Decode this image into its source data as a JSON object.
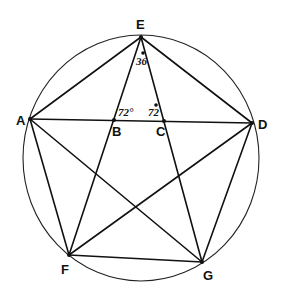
{
  "diagram": {
    "type": "inscribed-pentagon-with-pentagram",
    "colors": {
      "stroke": "#111111",
      "background": "#ffffff"
    },
    "circle": {
      "cx": 141,
      "cy": 158,
      "rx": 118,
      "ry": 123
    },
    "points": {
      "E": {
        "x": 141,
        "y": 37,
        "label": "E",
        "lx": 136,
        "ly": 29
      },
      "A": {
        "x": 30,
        "y": 119,
        "label": "A",
        "lx": 16,
        "ly": 125
      },
      "D": {
        "x": 252,
        "y": 123,
        "label": "D",
        "lx": 258,
        "ly": 129
      },
      "F": {
        "x": 69,
        "y": 255,
        "label": "F",
        "lx": 61,
        "ly": 274
      },
      "G": {
        "x": 202,
        "y": 262,
        "label": "G",
        "lx": 203,
        "ly": 280
      },
      "B": {
        "x": 114,
        "y": 120,
        "label": "B",
        "lx": 112,
        "ly": 136
      },
      "C": {
        "x": 164,
        "y": 121,
        "label": "C",
        "lx": 156,
        "ly": 136
      }
    },
    "segments": [
      [
        "A",
        "E"
      ],
      [
        "E",
        "D"
      ],
      [
        "D",
        "G"
      ],
      [
        "G",
        "F"
      ],
      [
        "F",
        "A"
      ],
      [
        "E",
        "F"
      ],
      [
        "E",
        "G"
      ],
      [
        "A",
        "D"
      ],
      [
        "A",
        "G"
      ],
      [
        "D",
        "F"
      ]
    ],
    "angle_labels": [
      {
        "text": "36",
        "x": 136,
        "y": 65
      },
      {
        "text": "72°",
        "x": 118,
        "y": 116
      },
      {
        "text": "72",
        "x": 148,
        "y": 116
      }
    ],
    "angle_dots": [
      {
        "x": 143,
        "y": 53
      },
      {
        "x": 156,
        "y": 105
      }
    ]
  }
}
